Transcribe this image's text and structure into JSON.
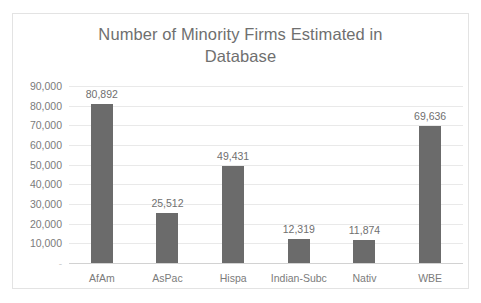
{
  "chart_data": {
    "type": "bar",
    "title": "Number of Minority Firms Estimated in Database",
    "title_line1": "Number of Minority Firms Estimated in",
    "title_line2": "Database",
    "xlabel": "",
    "ylabel": "",
    "categories": [
      "AfAm",
      "AsPac",
      "Hispa",
      "Indian-Subc",
      "Nativ",
      "WBE"
    ],
    "values": [
      80892,
      25512,
      49431,
      12319,
      11874,
      69636
    ],
    "value_labels": [
      "80,892",
      "25,512",
      "49,431",
      "12,319",
      "11,874",
      "69,636"
    ],
    "ylim": [
      0,
      90000
    ],
    "ytick_values": [
      0,
      10000,
      20000,
      30000,
      40000,
      50000,
      60000,
      70000,
      80000,
      90000
    ],
    "ytick_labels": [
      "-",
      "10,000",
      "20,000",
      "30,000",
      "40,000",
      "50,000",
      "60,000",
      "70,000",
      "80,000",
      "90,000"
    ],
    "grid": true,
    "legend": false,
    "bar_color": "#6b6b6b",
    "gridline_color": "#e9e9e9",
    "text_color": "#6f6f6f",
    "plot_background": "#ffffff"
  }
}
